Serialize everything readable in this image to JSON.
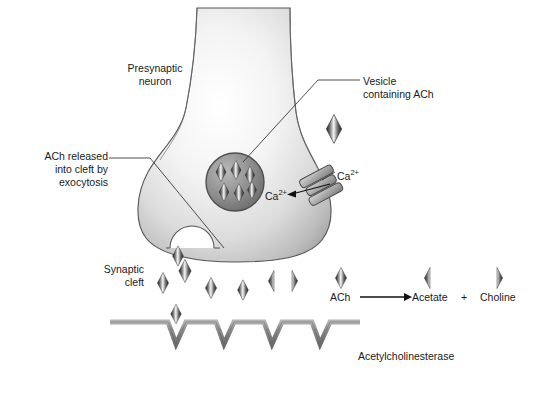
{
  "figure": {
    "background_color": "#ffffff",
    "width": 533,
    "height": 404
  },
  "labels": {
    "presynaptic_neuron": "Presynaptic\nneuron",
    "ach_released": "ACh released\ninto cleft by\nexocytosis",
    "vesicle_containing_ach": "Vesicle\ncontaining ACh",
    "calcium_outside": "Ca",
    "calcium_outside_charge": "2+",
    "calcium_inside": "Ca",
    "calcium_inside_charge": "2+",
    "synaptic_cleft": "Synaptic\ncleft",
    "acetylcholinesterase": "Acetylcholinesterase"
  },
  "reaction": {
    "substrate": "ACh",
    "arrow": "→",
    "product_one": "Acetate",
    "operator": "+",
    "product_two": "Choline"
  },
  "colors": {
    "outline": "#4a4a4a",
    "terminal_light": "#fdfdfd",
    "terminal_mid": "#d8d8d8",
    "terminal_dark": "#9a9a9a",
    "membrane": "#9b9b9b",
    "membrane_edge": "#6f6f6f",
    "molecule_dark": "#2b2b2b",
    "molecule_light": "#f2f2f2",
    "vesicle_fill": "#8f8f8f",
    "leader_line": "#3c3c3c",
    "text": "#1a1a1a"
  },
  "elements": {
    "vesicle_ach_count": 6,
    "cleft_molecule_count": 8,
    "membrane_notch_count": 5,
    "split_molecule_pairs": 1
  }
}
